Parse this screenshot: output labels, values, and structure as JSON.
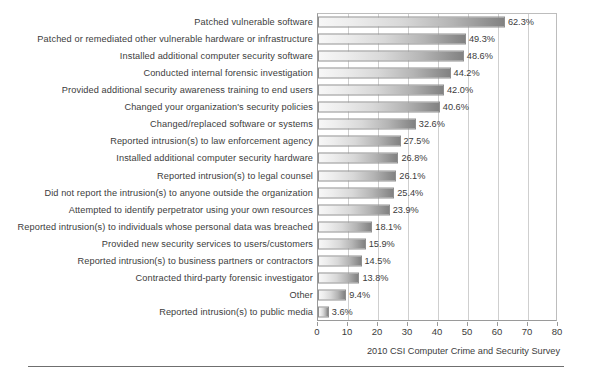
{
  "chart_data": {
    "type": "bar",
    "orientation": "horizontal",
    "title": "",
    "subtitle": "",
    "xlabel": "",
    "ylabel": "",
    "xlim": [
      0,
      80
    ],
    "xticks": [
      0,
      10,
      20,
      30,
      40,
      50,
      60,
      70,
      80
    ],
    "xtick_labels": [
      "0",
      "10",
      "20",
      "30",
      "40",
      "50",
      "60",
      "70",
      "80"
    ],
    "grid": true,
    "grid_axis": "x",
    "legend": false,
    "value_suffix": "%",
    "categories": [
      "Patched vulnerable software",
      "Patched or remediated other vulnerable hardware or infrastructure",
      "Installed additional computer security software",
      "Conducted internal forensic investigation",
      "Provided additional security awareness training to end users",
      "Changed your organization's security policies",
      "Changed/replaced software or systems",
      "Reported intrusion(s) to law enforcement agency",
      "Installed additional computer security hardware",
      "Reported intrusion(s) to legal counsel",
      "Did not report the intrusion(s) to anyone outside the organization",
      "Attempted to identify perpetrator using your own resources",
      "Reported intrusion(s) to individuals whose personal data was breached",
      "Provided new security services to users/customers",
      "Reported intrusion(s) to business partners or contractors",
      "Contracted third-party forensic investigator",
      "Other",
      "Reported intrusion(s) to public media"
    ],
    "values": [
      62.3,
      49.3,
      48.6,
      44.2,
      42.0,
      40.6,
      32.6,
      27.5,
      26.8,
      26.1,
      25.4,
      23.9,
      18.1,
      15.9,
      14.5,
      13.8,
      9.4,
      3.6
    ],
    "value_labels": [
      "62.3%",
      "49.3%",
      "48.6%",
      "44.2%",
      "42.0%",
      "40.6%",
      "32.6%",
      "27.5%",
      "26.8%",
      "26.1%",
      "25.4%",
      "23.9%",
      "18.1%",
      "15.9%",
      "14.5%",
      "13.8%",
      "9.4%",
      "3.6%"
    ],
    "bar_fill": "#c0c0c0",
    "bar_fill_light": "#f7f7f7",
    "bar_fill_dark": "#828282",
    "bar_border": "#8f8f8f",
    "grid_color": "#cfcfcf",
    "axis_color": "#9a9a9a"
  },
  "footer": {
    "source": "2010 CSI Computer Crime and Security Survey",
    "figure_caption": ""
  }
}
